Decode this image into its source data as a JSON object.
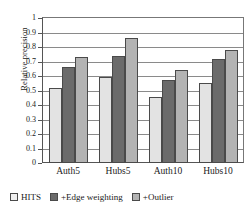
{
  "chart_data": {
    "type": "bar",
    "title": "",
    "xlabel": "",
    "ylabel": "Relative precision",
    "categories": [
      "Auth5",
      "Hubs5",
      "Auth10",
      "Hubs10"
    ],
    "series": [
      {
        "name": "HITS",
        "color": "#e3e3e3",
        "values": [
          0.52,
          0.59,
          0.455,
          0.555
        ]
      },
      {
        "name": "+Edge weighting",
        "color": "#6b6b6b",
        "values": [
          0.66,
          0.74,
          0.575,
          0.72
        ]
      },
      {
        "name": "+Outlier",
        "color": "#b3b3b3",
        "values": [
          0.73,
          0.865,
          0.64,
          0.78
        ]
      }
    ],
    "ylim": [
      0,
      1
    ],
    "yticks": [
      "0",
      "0.1",
      "0.2",
      "0.3",
      "0.4",
      "0.5",
      "0.6",
      "0.7",
      "0.8",
      "0.9",
      "1"
    ],
    "grid": true,
    "legend_position": "bottom"
  }
}
